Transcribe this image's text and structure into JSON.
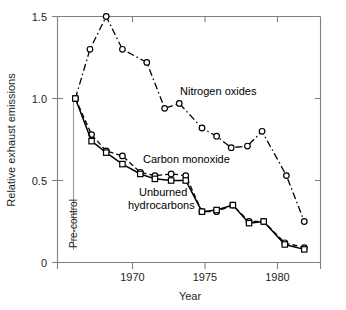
{
  "chart_data": {
    "type": "line",
    "title": "",
    "xlabel": "Year",
    "ylabel": "Relative exhaust emissions",
    "xlim": [
      1966.4,
      1982.6
    ],
    "ylim": [
      0,
      1.5
    ],
    "xticks": [
      1970,
      1975,
      1980
    ],
    "xtick_labels": [
      "1970",
      "1975",
      "1980"
    ],
    "yticks": [
      0,
      0.5,
      1.0,
      1.5
    ],
    "ytick_labels": [
      "0",
      "0.5",
      "1.0",
      "1.5"
    ],
    "grid": false,
    "legend_position": "inline-annotations",
    "annotations": [
      {
        "text": "Pre-control",
        "x": 1967.5,
        "y": 0.0,
        "orientation": "vertical"
      }
    ],
    "series": [
      {
        "name": "Nitrogen oxides",
        "label": "Nitrogen oxides",
        "linestyle": "dash-dot",
        "marker": "circle",
        "color": "#000000",
        "x": [
          1967.5,
          1968.4,
          1969.4,
          1970.4,
          1971.9,
          1973.0,
          1973.9,
          1975.3,
          1976.2,
          1977.1,
          1978.1,
          1979.0,
          1980.5,
          1981.6
        ],
        "values": [
          1.0,
          1.3,
          1.5,
          1.3,
          1.22,
          0.94,
          0.97,
          0.82,
          0.77,
          0.7,
          0.71,
          0.8,
          0.53,
          0.25
        ]
      },
      {
        "name": "Carbon monoxide",
        "label": "Carbon monoxide",
        "linestyle": "dashed",
        "marker": "circle",
        "color": "#000000",
        "x": [
          1967.5,
          1968.5,
          1969.4,
          1970.4,
          1971.5,
          1972.4,
          1973.4,
          1974.3,
          1975.3,
          1976.2,
          1977.2,
          1978.2,
          1979.1,
          1980.4,
          1981.6
        ],
        "values": [
          1.0,
          0.78,
          0.68,
          0.65,
          0.55,
          0.53,
          0.54,
          0.53,
          0.31,
          0.31,
          0.35,
          0.25,
          0.25,
          0.12,
          0.09
        ]
      },
      {
        "name": "Unburned hydrocarbons",
        "label": "Unburned hydrocarbons",
        "linestyle": "solid",
        "marker": "square",
        "color": "#000000",
        "x": [
          1967.5,
          1968.5,
          1969.4,
          1970.4,
          1971.5,
          1972.4,
          1973.4,
          1974.3,
          1975.3,
          1976.2,
          1977.2,
          1978.2,
          1979.1,
          1980.4,
          1981.6
        ],
        "values": [
          1.0,
          0.74,
          0.67,
          0.6,
          0.54,
          0.51,
          0.5,
          0.5,
          0.31,
          0.32,
          0.35,
          0.24,
          0.25,
          0.11,
          0.08
        ]
      }
    ]
  },
  "labels": {
    "nitrogen_oxides": "Nitrogen oxides",
    "carbon_monoxide": "Carbon monoxide",
    "unburned_line1": "Unburned",
    "unburned_line2": "hydrocarbons",
    "precontrol": "Pre-control",
    "xaxis": "Year",
    "yaxis": "Relative exhaust emissions",
    "ytick_0": "0",
    "ytick_05": "0.5",
    "ytick_10": "1.0",
    "ytick_15": "1.5",
    "xtick_1970": "1970",
    "xtick_1975": "1975",
    "xtick_1980": "1980"
  },
  "colors": {
    "axis": "#808080",
    "curve": "#000000",
    "text": "#231f20",
    "background": "#ffffff",
    "annotation_line": "#9a9a9a"
  }
}
